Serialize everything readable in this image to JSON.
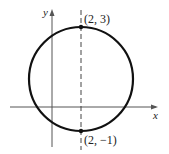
{
  "diagram": {
    "type": "circle-on-axes",
    "axes": {
      "x_label": "x",
      "y_label": "y"
    },
    "points": [
      {
        "label": "(2, 3)",
        "x": 2,
        "y": 3
      },
      {
        "label": "(2, −1)",
        "x": 2,
        "y": -1
      }
    ],
    "dashed_line": {
      "x": 2
    },
    "colors": {
      "stroke": "#111111",
      "axis": "#555555"
    }
  }
}
